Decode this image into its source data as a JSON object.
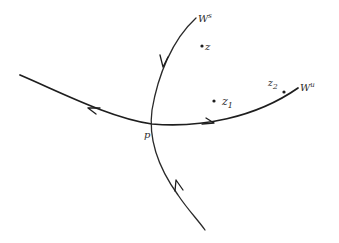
{
  "diagram": {
    "type": "stable-unstable-manifold-sketch",
    "labels": {
      "stable_manifold": "W",
      "stable_manifold_sup": "s",
      "unstable_manifold": "W",
      "unstable_manifold_sup": "u",
      "fixed_point": "p",
      "point_z": "z",
      "point_z1": "z",
      "point_z1_sub": "1",
      "point_z2": "z",
      "point_z2_sub": "2"
    },
    "curves": [
      {
        "name": "stable-manifold",
        "label": "Ws",
        "arrows": [
          "toward-p-from-top",
          "toward-p-from-bottom"
        ]
      },
      {
        "name": "unstable-manifold",
        "label": "Wu",
        "arrows": [
          "away-from-p-left",
          "away-from-p-right"
        ]
      }
    ],
    "points": [
      "p",
      "z",
      "z1",
      "z2"
    ],
    "colors": {
      "ink": "#1e1e1e",
      "background": "#ffffff"
    }
  }
}
